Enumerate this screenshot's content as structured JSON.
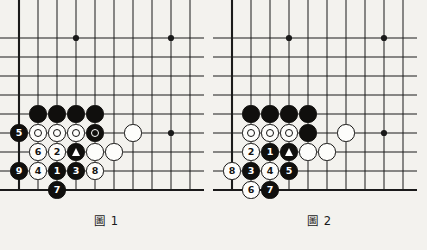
{
  "document": {
    "type": "go-joseki-diagrams",
    "background_color": "#f3f2ee",
    "line_color": "#1a1a1a",
    "black_stone_color": "#100f0d",
    "white_stone_color": "#fdfdfb"
  },
  "board": {
    "cols": 10,
    "rows": 10,
    "origin_x": 19,
    "origin_y": 19,
    "step": 19,
    "edge_left": true,
    "edge_bottom": true,
    "star_points": [
      {
        "col": 3,
        "row": 1
      },
      {
        "col": 8,
        "row": 1
      },
      {
        "col": 8,
        "row": 6
      }
    ]
  },
  "figures": [
    {
      "id": "figure-1",
      "caption": "圖 1",
      "caption_number": "1",
      "stones": [
        {
          "col": 1,
          "row": 5,
          "color": "black",
          "label": "",
          "marker": ""
        },
        {
          "col": 2,
          "row": 5,
          "color": "black",
          "label": "",
          "marker": ""
        },
        {
          "col": 3,
          "row": 5,
          "color": "black",
          "label": "",
          "marker": ""
        },
        {
          "col": 4,
          "row": 5,
          "color": "black",
          "label": "",
          "marker": ""
        },
        {
          "col": 0,
          "row": 6,
          "color": "black",
          "label": "5",
          "marker": ""
        },
        {
          "col": 1,
          "row": 6,
          "color": "white",
          "label": "",
          "marker": "ring"
        },
        {
          "col": 2,
          "row": 6,
          "color": "white",
          "label": "",
          "marker": "ring"
        },
        {
          "col": 3,
          "row": 6,
          "color": "white",
          "label": "",
          "marker": "ring"
        },
        {
          "col": 4,
          "row": 6,
          "color": "black",
          "label": "",
          "marker": "ring"
        },
        {
          "col": 6,
          "row": 6,
          "color": "white",
          "label": "",
          "marker": ""
        },
        {
          "col": 1,
          "row": 7,
          "color": "white",
          "label": "6",
          "marker": ""
        },
        {
          "col": 2,
          "row": 7,
          "color": "white",
          "label": "2",
          "marker": ""
        },
        {
          "col": 3,
          "row": 7,
          "color": "black",
          "label": "",
          "marker": "triangle"
        },
        {
          "col": 4,
          "row": 7,
          "color": "white",
          "label": "",
          "marker": ""
        },
        {
          "col": 5,
          "row": 7,
          "color": "white",
          "label": "",
          "marker": ""
        },
        {
          "col": 0,
          "row": 8,
          "color": "black",
          "label": "9",
          "marker": ""
        },
        {
          "col": 1,
          "row": 8,
          "color": "white",
          "label": "4",
          "marker": ""
        },
        {
          "col": 2,
          "row": 8,
          "color": "black",
          "label": "1",
          "marker": ""
        },
        {
          "col": 3,
          "row": 8,
          "color": "black",
          "label": "3",
          "marker": ""
        },
        {
          "col": 4,
          "row": 8,
          "color": "white",
          "label": "8",
          "marker": ""
        },
        {
          "col": 2,
          "row": 9,
          "color": "black",
          "label": "7",
          "marker": ""
        }
      ]
    },
    {
      "id": "figure-2",
      "caption": "圖 2",
      "caption_number": "2",
      "stones": [
        {
          "col": 1,
          "row": 5,
          "color": "black",
          "label": "",
          "marker": ""
        },
        {
          "col": 2,
          "row": 5,
          "color": "black",
          "label": "",
          "marker": ""
        },
        {
          "col": 3,
          "row": 5,
          "color": "black",
          "label": "",
          "marker": ""
        },
        {
          "col": 4,
          "row": 5,
          "color": "black",
          "label": "",
          "marker": ""
        },
        {
          "col": 1,
          "row": 6,
          "color": "white",
          "label": "",
          "marker": "ring"
        },
        {
          "col": 2,
          "row": 6,
          "color": "white",
          "label": "",
          "marker": "ring"
        },
        {
          "col": 3,
          "row": 6,
          "color": "white",
          "label": "",
          "marker": "ring"
        },
        {
          "col": 4,
          "row": 6,
          "color": "black",
          "label": "",
          "marker": ""
        },
        {
          "col": 6,
          "row": 6,
          "color": "white",
          "label": "",
          "marker": ""
        },
        {
          "col": 1,
          "row": 7,
          "color": "white",
          "label": "2",
          "marker": ""
        },
        {
          "col": 2,
          "row": 7,
          "color": "black",
          "label": "1",
          "marker": ""
        },
        {
          "col": 3,
          "row": 7,
          "color": "black",
          "label": "",
          "marker": "triangle"
        },
        {
          "col": 4,
          "row": 7,
          "color": "white",
          "label": "",
          "marker": ""
        },
        {
          "col": 5,
          "row": 7,
          "color": "white",
          "label": "",
          "marker": ""
        },
        {
          "col": 0,
          "row": 8,
          "color": "white",
          "label": "8",
          "marker": ""
        },
        {
          "col": 1,
          "row": 8,
          "color": "black",
          "label": "3",
          "marker": ""
        },
        {
          "col": 2,
          "row": 8,
          "color": "white",
          "label": "4",
          "marker": ""
        },
        {
          "col": 3,
          "row": 8,
          "color": "black",
          "label": "5",
          "marker": ""
        },
        {
          "col": 1,
          "row": 9,
          "color": "white",
          "label": "6",
          "marker": ""
        },
        {
          "col": 2,
          "row": 9,
          "color": "black",
          "label": "7",
          "marker": ""
        }
      ]
    }
  ]
}
